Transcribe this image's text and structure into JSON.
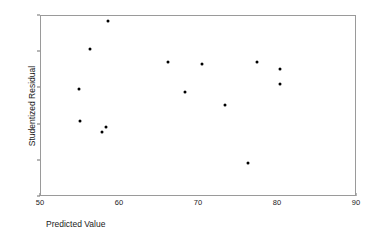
{
  "chart_data": {
    "type": "scatter",
    "title": "",
    "xlabel": "Predicted Value",
    "ylabel": "Studentized Residual",
    "xlim": [
      50,
      90
    ],
    "ylim": [
      -3,
      2
    ],
    "xticks": [
      50,
      60,
      70,
      80,
      90
    ],
    "yticks": [
      2,
      1,
      0,
      -1,
      -2,
      -3
    ],
    "grid": false,
    "legend": null,
    "marker_color": "#000000",
    "axis_color": "#9a9a9a",
    "points": [
      {
        "x": 58.5,
        "y": 1.86
      },
      {
        "x": 56.2,
        "y": 1.09
      },
      {
        "x": 54.8,
        "y": -0.03
      },
      {
        "x": 54.9,
        "y": -0.89
      },
      {
        "x": 57.7,
        "y": -1.2
      },
      {
        "x": 58.2,
        "y": -1.06
      },
      {
        "x": 66.1,
        "y": 0.74
      },
      {
        "x": 68.2,
        "y": -0.11
      },
      {
        "x": 70.4,
        "y": 0.68
      },
      {
        "x": 73.3,
        "y": -0.46
      },
      {
        "x": 76.2,
        "y": -2.07
      },
      {
        "x": 77.3,
        "y": 0.73
      },
      {
        "x": 80.3,
        "y": 0.53
      },
      {
        "x": 80.3,
        "y": 0.11
      }
    ]
  }
}
